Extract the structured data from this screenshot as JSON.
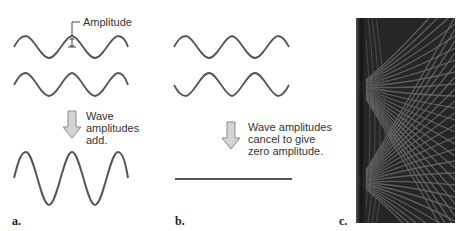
{
  "figure": {
    "panels": [
      {
        "id": "a",
        "letter": "a.",
        "annotation_label": "Amplitude",
        "arrow_text": "Wave\namplitudes\nadd.",
        "description": "Constructive interference: two in-phase waves combine into a wave of doubled amplitude"
      },
      {
        "id": "b",
        "letter": "b.",
        "arrow_text": "Wave amplitudes\ncancel to give\nzero amplitude.",
        "description": "Destructive interference: two out-of-phase waves cancel to a flat line"
      },
      {
        "id": "c",
        "letter": "c.",
        "description": "Interference pattern image from two wave sources"
      }
    ],
    "colors": {
      "wave_stroke": "#555555",
      "arrow_fill": "#d4d4d4",
      "arrow_stroke": "#8a8a8a",
      "text": "#333333",
      "pattern_dark": "#1e1e1e",
      "pattern_light": "#6a6a6a"
    }
  }
}
